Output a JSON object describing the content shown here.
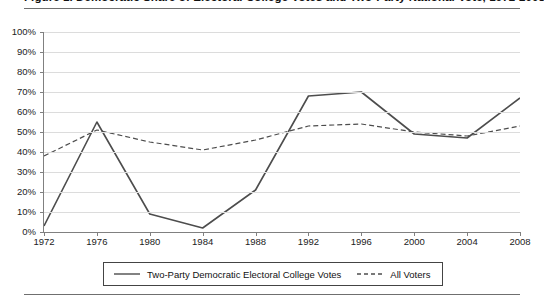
{
  "figure": {
    "title": "Figure 1. Democratic Share of Electoral College Votes and Two-Party National Vote, 1972-2008",
    "title_note": "clipped at top edge of screenshot"
  },
  "chart_data": {
    "type": "line",
    "title": "Democratic Share of Electoral College Votes and Two-Party National Vote, 1972-2008",
    "xlabel": "",
    "ylabel": "",
    "categories": [
      "1972",
      "1976",
      "1980",
      "1984",
      "1988",
      "1992",
      "1996",
      "2000",
      "2004",
      "2008"
    ],
    "ylim": [
      0,
      100
    ],
    "ytick_labels": [
      "0%",
      "10%",
      "20%",
      "30%",
      "40%",
      "50%",
      "60%",
      "70%",
      "80%",
      "90%",
      "100%"
    ],
    "ytick_values": [
      0,
      10,
      20,
      30,
      40,
      50,
      60,
      70,
      80,
      90,
      100
    ],
    "grid": true,
    "legend_position": "bottom",
    "series": [
      {
        "name": "Two-Party Democratic Electoral College Votes",
        "style": "solid",
        "color": "#4d4d4d",
        "values": [
          3,
          55,
          9,
          2,
          21,
          68,
          70,
          49,
          47,
          67
        ]
      },
      {
        "name": "All Voters",
        "style": "dashed",
        "color": "#4d4d4d",
        "values": [
          38,
          51,
          45,
          41,
          46,
          53,
          54,
          50,
          48,
          53
        ]
      }
    ]
  },
  "legend": {
    "items": [
      {
        "label": "Two-Party Democratic Electoral College Votes",
        "style": "solid"
      },
      {
        "label": "All Voters",
        "style": "dashed"
      }
    ]
  },
  "colors": {
    "line": "#4d4d4d",
    "grid": "#dcdcdc",
    "axis": "#808080",
    "rule": "#6f6f6f",
    "text": "#1a1a1a"
  }
}
